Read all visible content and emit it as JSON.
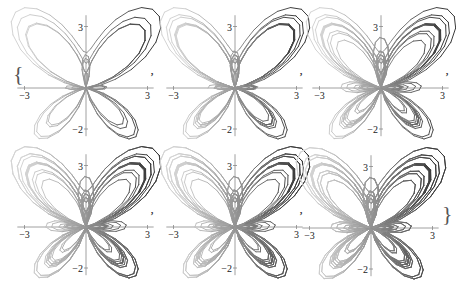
{
  "chart_data": {
    "type": "line",
    "title": "",
    "xlabel": "",
    "ylabel": "",
    "xlim": [
      -3,
      3
    ],
    "ylim": [
      -2,
      3
    ],
    "x_tick_labels": [
      "−3",
      "3"
    ],
    "y_tick_labels": [
      "3",
      "−2"
    ],
    "grid": false,
    "legend": null,
    "separator": ",",
    "panels": [
      {
        "index": 1,
        "theta_max_pi": 8,
        "label_left_brace": true,
        "label_right_brace": false
      },
      {
        "index": 2,
        "theta_max_pi": 16,
        "label_left_brace": false,
        "label_right_brace": false
      },
      {
        "index": 3,
        "theta_max_pi": 24,
        "label_left_brace": false,
        "label_right_brace": false
      },
      {
        "index": 4,
        "theta_max_pi": 32,
        "label_left_brace": false,
        "label_right_brace": false
      },
      {
        "index": 5,
        "theta_max_pi": 40,
        "label_left_brace": false,
        "label_right_brace": false
      },
      {
        "index": 6,
        "theta_max_pi": 48,
        "label_left_brace": false,
        "label_right_brace": true
      }
    ],
    "colors": {
      "curve_light": "#d4d4d4",
      "curve_dark": "#3a3a3a",
      "axis": "#888888"
    }
  },
  "labels": {
    "x_min": "−3",
    "x_max": "3",
    "y_max": "3",
    "y_min": "−2",
    "comma": ",",
    "brace_left": "{",
    "brace_right": "}"
  }
}
